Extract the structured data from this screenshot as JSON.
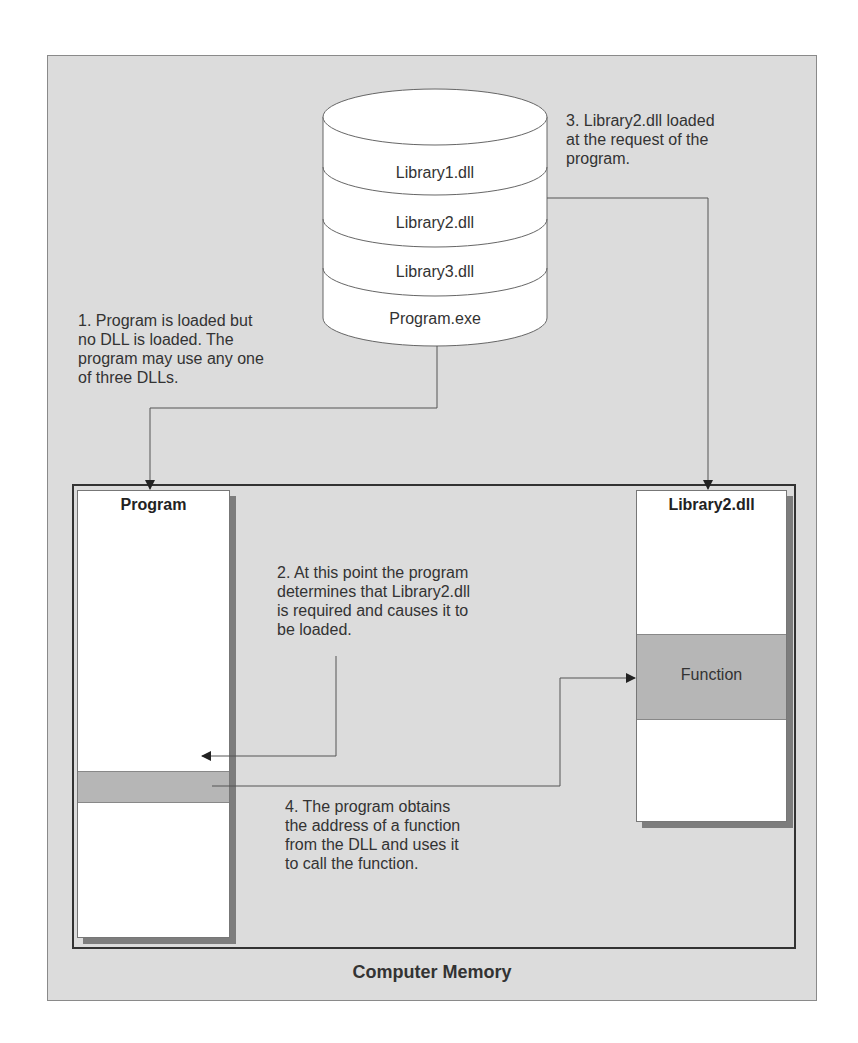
{
  "diagram": {
    "container_label": "Computer Memory",
    "storage": {
      "items": [
        "Library1.dll",
        "Library2.dll",
        "Library3.dll",
        "Program.exe"
      ]
    },
    "program_block": {
      "title": "Program"
    },
    "library_block": {
      "title": "Library2.dll",
      "function_label": "Function"
    },
    "steps": [
      {
        "text_lines": [
          "1. Program is loaded but",
          "no DLL is loaded. The",
          "program may use any one",
          "of three DLLs."
        ]
      },
      {
        "text_lines": [
          "2. At this point the program",
          "determines that Library2.dll",
          "is required and causes it to",
          "be loaded."
        ]
      },
      {
        "text_lines": [
          "3. Library2.dll loaded",
          "at the request of the",
          "program."
        ]
      },
      {
        "text_lines": [
          "4. The program obtains",
          "the address of a function",
          "from the DLL and uses it",
          "to call the function."
        ]
      }
    ],
    "colors": {
      "background": "#dcdcdc",
      "box_fill": "#ffffff",
      "highlight_band": "#b6b6b6",
      "shadow": "#7d7d7d",
      "line": "#444444"
    }
  }
}
